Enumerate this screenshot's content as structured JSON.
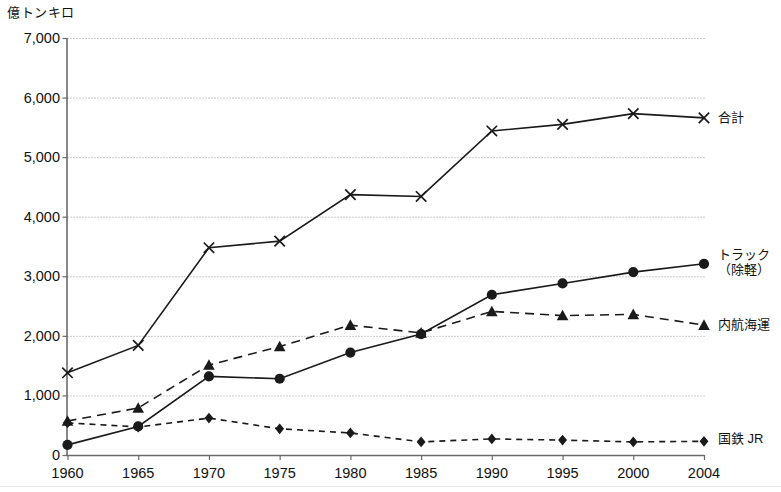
{
  "chart_data": {
    "type": "line",
    "title": "",
    "unit_label": "億トンキロ",
    "xlabel": "",
    "ylabel": "億トンキロ",
    "grid": true,
    "legend_position": "right-of-plot",
    "x": [
      1960,
      1965,
      1970,
      1975,
      1980,
      1985,
      1990,
      1995,
      2000,
      2004
    ],
    "categories": [
      "1960",
      "1965",
      "1970",
      "1975",
      "1980",
      "1985",
      "1990",
      "1995",
      "2000",
      "2004"
    ],
    "ylim": [
      0,
      7000
    ],
    "yticks": [
      0,
      1000,
      2000,
      3000,
      4000,
      5000,
      6000,
      7000
    ],
    "ytick_labels": [
      "0",
      "1,000",
      "2,000",
      "3,000",
      "4,000",
      "5,000",
      "6,000",
      "7,000"
    ],
    "series": [
      {
        "name": "合計",
        "label": "合計",
        "marker": "cross",
        "line": "solid",
        "color": "#1a1a1a",
        "values": [
          1380,
          1840,
          3480,
          3590,
          4370,
          4340,
          5440,
          5550,
          5730,
          5660
        ]
      },
      {
        "name": "トラック(除軽)",
        "label": "トラック",
        "label_line2": "（除軽）",
        "marker": "circle",
        "line": "solid",
        "color": "#1a1a1a",
        "values": [
          170,
          480,
          1320,
          1280,
          1720,
          2030,
          2690,
          2880,
          3070,
          3210
        ]
      },
      {
        "name": "内航海運",
        "label": "内航海運",
        "marker": "triangle",
        "line": "dashed",
        "color": "#1a1a1a",
        "values": [
          570,
          790,
          1510,
          1820,
          2180,
          2050,
          2410,
          2340,
          2360,
          2180
        ]
      },
      {
        "name": "国鉄JR",
        "label": "国鉄 JR",
        "marker": "diamond",
        "line": "dashed",
        "color": "#1a1a1a",
        "values": [
          540,
          470,
          620,
          440,
          370,
          220,
          270,
          250,
          220,
          230
        ]
      }
    ]
  },
  "axis": {
    "y_unit": "億トンキロ",
    "y_ticks": [
      "7,000",
      "6,000",
      "5,000",
      "4,000",
      "3,000",
      "2,000",
      "1,000",
      "0"
    ],
    "x_ticks": [
      "1960",
      "1965",
      "1970",
      "1975",
      "1980",
      "1985",
      "1990",
      "1995",
      "2000",
      "2004"
    ]
  },
  "labels": {
    "total": "合計",
    "truck_line1": "トラック",
    "truck_line2": "（除軽）",
    "coastal": "内航海運",
    "rail": "国鉄 JR"
  }
}
